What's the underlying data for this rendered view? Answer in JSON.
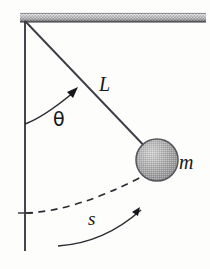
{
  "figure": {
    "name": "simple-pendulum-diagram",
    "background_color": "#fdfdfc",
    "ink_color": "#17171a",
    "stroke_color": "#4a4a52"
  },
  "labels": {
    "length": "L",
    "mass": "m",
    "arc_length": "s",
    "angle": "θ"
  },
  "geometry": {
    "pivot": {
      "x": 25,
      "y": 22
    },
    "bob_center": {
      "x": 157,
      "y": 160
    },
    "bob_radius": 21,
    "vertical_line": {
      "x": 25,
      "y_top": 22,
      "y_bottom": 251
    },
    "ceiling_bar": {
      "x": 20,
      "y": 13,
      "width": 186,
      "height": 9
    },
    "tick_mark": {
      "x1": 18,
      "x2": 33,
      "y": 213
    }
  },
  "elements": {
    "ceiling": "hatched-ceiling-bar",
    "string": "pendulum-string",
    "vertical_reference": "vertical-reference-line",
    "bob": "pendulum-bob",
    "angle_arc": "angle-arc-arrow",
    "swing_arc": "dashed-swing-arc",
    "direction_arrow": "swing-direction-arrow"
  },
  "colors": {
    "ceiling_light": "#e8e8e8",
    "ceiling_dark": "#4d4d52",
    "bob_fill": "#a9a9a9",
    "bob_highlight": "#cfcfcf",
    "bob_outline": "#5a5a60"
  }
}
